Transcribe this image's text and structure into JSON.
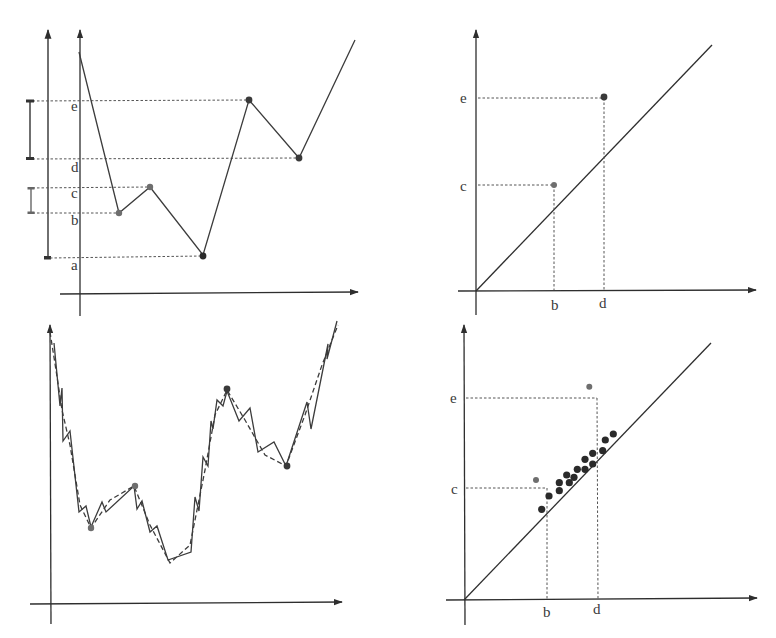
{
  "figure": {
    "panels": [
      {
        "id": "top-left",
        "title": "Function graph with critical values"
      },
      {
        "id": "top-right",
        "title": "Persistence diagram"
      },
      {
        "id": "bottom-left",
        "title": "Noisy function graph"
      },
      {
        "id": "bottom-right",
        "title": "Persistence diagram with noise"
      }
    ]
  },
  "colors": {
    "axis": "#2e2e2e",
    "curve": "#3c3c3c",
    "point_dark": "#2a2a2a",
    "point_gray": "#6e6e6e",
    "guide": "#555555"
  },
  "labels": {
    "a": "a",
    "b": "b",
    "c": "c",
    "d": "d",
    "e": "e"
  },
  "chart_data": [
    {
      "type": "line",
      "panel": "top-left",
      "title": "",
      "xlabel": "",
      "ylabel": "",
      "y_tick_labels": [
        "a",
        "b",
        "c",
        "d",
        "e"
      ],
      "polyline_px": [
        [
          79,
          52
        ],
        [
          119,
          213
        ],
        [
          150,
          187
        ],
        [
          203,
          255
        ],
        [
          249,
          100
        ],
        [
          299,
          158
        ],
        [
          355,
          40
        ]
      ],
      "critical_points": [
        {
          "label": "b",
          "x": 119,
          "y": 213,
          "tone": "gray"
        },
        {
          "label": "c",
          "x": 150,
          "y": 187,
          "tone": "gray"
        },
        {
          "label": "a",
          "x": 203,
          "y": 255,
          "tone": "dark"
        },
        {
          "label": "e",
          "x": 249,
          "y": 100,
          "tone": "dark"
        },
        {
          "label": "d",
          "x": 299,
          "y": 158,
          "tone": "dark"
        }
      ],
      "levels_px": {
        "e": 101,
        "d": 159,
        "c": 188,
        "b": 213,
        "a": 258
      },
      "brackets": [
        {
          "from": "d",
          "to": "e",
          "x": 29
        },
        {
          "from": "b",
          "to": "c",
          "x": 30
        },
        {
          "from": "a",
          "to": "top",
          "x": 48
        }
      ]
    },
    {
      "type": "scatter",
      "panel": "top-right",
      "title": "",
      "x_tick_labels": [
        "b",
        "d"
      ],
      "y_tick_labels": [
        "c",
        "e"
      ],
      "diagonal": true,
      "points": [
        {
          "x_label": "b",
          "y_label": "c",
          "tone": "gray"
        },
        {
          "x_label": "d",
          "y_label": "e",
          "tone": "dark"
        }
      ]
    },
    {
      "type": "line",
      "panel": "bottom-left",
      "title": "",
      "series": [
        {
          "name": "noisy",
          "style": "solid"
        },
        {
          "name": "smooth",
          "style": "dashed"
        }
      ],
      "noisy_px": [
        [
          54,
          343
        ],
        [
          60,
          406
        ],
        [
          62,
          388
        ],
        [
          63,
          441
        ],
        [
          70,
          431
        ],
        [
          79,
          512
        ],
        [
          86,
          506
        ],
        [
          91,
          527
        ],
        [
          102,
          502
        ],
        [
          106,
          512
        ],
        [
          134,
          486
        ],
        [
          137,
          509
        ],
        [
          142,
          501
        ],
        [
          150,
          532
        ],
        [
          157,
          526
        ],
        [
          168,
          560
        ],
        [
          191,
          552
        ],
        [
          195,
          497
        ],
        [
          199,
          511
        ],
        [
          203,
          457
        ],
        [
          208,
          466
        ],
        [
          211,
          421
        ],
        [
          213,
          429
        ],
        [
          217,
          400
        ],
        [
          223,
          406
        ],
        [
          227,
          391
        ],
        [
          239,
          421
        ],
        [
          250,
          408
        ],
        [
          258,
          452
        ],
        [
          274,
          442
        ],
        [
          286,
          466
        ],
        [
          307,
          402
        ],
        [
          311,
          429
        ],
        [
          328,
          344
        ],
        [
          327,
          359
        ],
        [
          337,
          321
        ]
      ],
      "smooth_px": [
        [
          50,
          330
        ],
        [
          56,
          370
        ],
        [
          62,
          410
        ],
        [
          70,
          445
        ],
        [
          80,
          505
        ],
        [
          91,
          528
        ],
        [
          110,
          500
        ],
        [
          134,
          486
        ],
        [
          150,
          525
        ],
        [
          170,
          563
        ],
        [
          190,
          545
        ],
        [
          205,
          470
        ],
        [
          215,
          415
        ],
        [
          227,
          390
        ],
        [
          245,
          420
        ],
        [
          265,
          455
        ],
        [
          286,
          466
        ],
        [
          305,
          415
        ],
        [
          322,
          365
        ],
        [
          338,
          325
        ]
      ],
      "highlight_points": [
        {
          "x": 91,
          "y": 528,
          "tone": "gray"
        },
        {
          "x": 135,
          "y": 486,
          "tone": "gray"
        },
        {
          "x": 227,
          "y": 389,
          "tone": "dark"
        },
        {
          "x": 287,
          "y": 466,
          "tone": "dark"
        }
      ]
    },
    {
      "type": "scatter",
      "panel": "bottom-right",
      "title": "",
      "x_tick_labels": [
        "b",
        "d"
      ],
      "y_tick_labels": [
        "c",
        "e"
      ],
      "diagonal": true,
      "points_px": [
        {
          "x": 541.7,
          "y": 509.3,
          "tone": "dark"
        },
        {
          "x": 549,
          "y": 496,
          "tone": "dark"
        },
        {
          "x": 559.3,
          "y": 490.7,
          "tone": "dark"
        },
        {
          "x": 559.3,
          "y": 482.7,
          "tone": "dark"
        },
        {
          "x": 569.3,
          "y": 482.7,
          "tone": "dark"
        },
        {
          "x": 566.7,
          "y": 475,
          "tone": "dark"
        },
        {
          "x": 574,
          "y": 477.3,
          "tone": "dark"
        },
        {
          "x": 577.3,
          "y": 469.3,
          "tone": "dark"
        },
        {
          "x": 585,
          "y": 469.3,
          "tone": "dark"
        },
        {
          "x": 585,
          "y": 459.3,
          "tone": "dark"
        },
        {
          "x": 592.7,
          "y": 464,
          "tone": "dark"
        },
        {
          "x": 592.7,
          "y": 453.3,
          "tone": "dark"
        },
        {
          "x": 602.7,
          "y": 450.7,
          "tone": "dark"
        },
        {
          "x": 605.3,
          "y": 440,
          "tone": "dark"
        },
        {
          "x": 613.3,
          "y": 434,
          "tone": "dark"
        },
        {
          "x": 536,
          "y": 480,
          "tone": "gray"
        },
        {
          "x": 589.3,
          "y": 386.7,
          "tone": "gray"
        }
      ]
    }
  ]
}
